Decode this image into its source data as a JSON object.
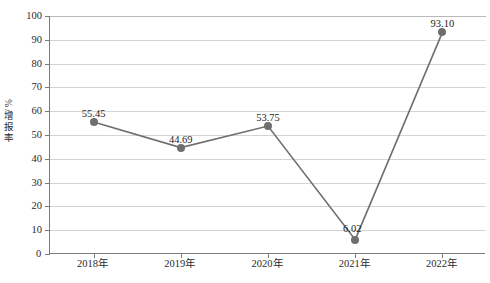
{
  "chart_data": {
    "type": "line",
    "title": "",
    "xlabel": "",
    "ylabel": "增报率 / %",
    "ylabel_chars": [
      "增",
      "报",
      "率"
    ],
    "ylabel_unit": "/ %",
    "categories": [
      "2018年",
      "2019年",
      "2020年",
      "2021年",
      "2022年"
    ],
    "values": [
      55.45,
      44.69,
      53.75,
      6.02,
      93.1
    ],
    "data_labels": [
      "55.45",
      "44.69",
      "53.75",
      "6.02",
      "93.10"
    ],
    "ylim": [
      0,
      100
    ],
    "ytick_step": 10,
    "yticks": [
      0,
      10,
      20,
      30,
      40,
      50,
      60,
      70,
      80,
      90,
      100
    ],
    "ytick_labels": [
      "0",
      "10",
      "20",
      "30",
      "40",
      "50",
      "60",
      "70",
      "80",
      "90",
      "100"
    ],
    "grid": "horizontal",
    "legend": "none",
    "series": [
      {
        "name": "增报率",
        "values": [
          55.45,
          44.69,
          53.75,
          6.02,
          93.1
        ],
        "line_color": "#6e6e6e",
        "marker_color": "#6e6e6e",
        "marker_shape": "circle"
      }
    ],
    "colors": {
      "line": "#6e6e6e",
      "marker": "#6e6e6e",
      "gridline": "#d4d4d4",
      "axis": "#7a7a7a",
      "text": "#2b2b2b",
      "background": "#ffffff"
    }
  }
}
